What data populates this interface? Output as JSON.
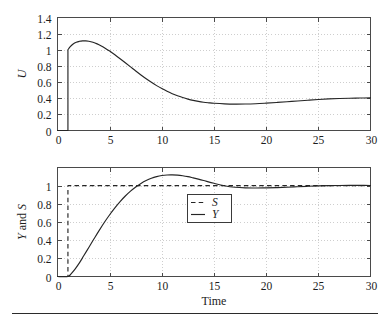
{
  "figure": {
    "background_color": "#ffffff",
    "line_color": "#252525",
    "grid_color": "#b9b9b9",
    "frame_color": "#4a4a4a",
    "bottom_rule": true
  },
  "chart_data": [
    {
      "type": "line",
      "panel": "top",
      "title": "",
      "xlabel": "",
      "ylabel": "U",
      "xlim": [
        0,
        30
      ],
      "ylim": [
        0,
        1.4
      ],
      "grid": true,
      "legend": null,
      "xticks": [
        0,
        5,
        10,
        15,
        20,
        25,
        30
      ],
      "xtick_labels": [
        "0",
        "5",
        "10",
        "15",
        "20",
        "25",
        "30"
      ],
      "yticks": [
        0,
        0.2,
        0.4,
        0.6,
        0.8,
        1,
        1.2,
        1.4
      ],
      "ytick_labels": [
        "0",
        "0.2",
        "0.4",
        "0.6",
        "0.8",
        "1",
        "1.2",
        "1.4"
      ],
      "series": [
        {
          "name": "U",
          "style": "solid",
          "x": [
            0,
            0.5,
            1.0,
            1.0,
            1.2,
            1.5,
            1.8,
            2.1,
            2.4,
            2.7,
            3.0,
            3.4,
            3.8,
            4.2,
            4.6,
            5.0,
            5.5,
            6.0,
            6.5,
            7.0,
            7.5,
            8.0,
            8.5,
            9.0,
            9.5,
            10.0,
            10.5,
            11.0,
            11.5,
            12.0,
            12.5,
            13.0,
            13.5,
            14.0,
            14.5,
            15.0,
            16.0,
            17.0,
            18.0,
            19.0,
            20.0,
            21.0,
            22.0,
            23.0,
            24.0,
            25.0,
            26.0,
            27.0,
            28.0,
            29.0,
            30.0
          ],
          "y": [
            0,
            0,
            0,
            1.0,
            1.035,
            1.072,
            1.094,
            1.105,
            1.11,
            1.11,
            1.106,
            1.093,
            1.073,
            1.047,
            1.017,
            0.984,
            0.938,
            0.889,
            0.839,
            0.788,
            0.737,
            0.688,
            0.641,
            0.597,
            0.556,
            0.519,
            0.486,
            0.456,
            0.43,
            0.408,
            0.389,
            0.373,
            0.36,
            0.35,
            0.343,
            0.337,
            0.33,
            0.327,
            0.328,
            0.332,
            0.339,
            0.347,
            0.356,
            0.366,
            0.375,
            0.384,
            0.391,
            0.396,
            0.4,
            0.402,
            0.404
          ]
        }
      ]
    },
    {
      "type": "line",
      "panel": "bottom",
      "title": "",
      "xlabel": "Time",
      "ylabel": "Y and S",
      "xlim": [
        0,
        30
      ],
      "ylim": [
        0,
        1.2
      ],
      "grid": true,
      "legend_position": "center",
      "xticks": [
        0,
        5,
        10,
        15,
        20,
        25,
        30
      ],
      "xtick_labels": [
        "0",
        "5",
        "10",
        "15",
        "20",
        "25",
        "30"
      ],
      "yticks": [
        0,
        0.2,
        0.4,
        0.6,
        0.8,
        1
      ],
      "ytick_labels": [
        "0",
        "0.2",
        "0.4",
        "0.6",
        "0.8",
        "1"
      ],
      "series": [
        {
          "name": "S",
          "style": "dashed",
          "x": [
            0,
            1.0,
            1.0,
            30
          ],
          "y": [
            0,
            0,
            1.0,
            1.0
          ]
        },
        {
          "name": "Y",
          "style": "solid",
          "x": [
            0,
            1.0,
            1.3,
            1.7,
            2.1,
            2.5,
            3.0,
            3.5,
            4.0,
            4.5,
            5.0,
            5.5,
            6.0,
            6.5,
            7.0,
            7.5,
            8.0,
            8.5,
            9.0,
            9.5,
            10.0,
            10.5,
            11.0,
            11.5,
            12.0,
            12.5,
            13.0,
            13.5,
            14.0,
            15.0,
            16.0,
            17.0,
            18.0,
            19.0,
            20.0,
            21.0,
            22.0,
            23.0,
            24.0,
            25.0,
            26.0,
            27.0,
            28.0,
            29.0,
            30.0
          ],
          "y": [
            0,
            0,
            0.03,
            0.085,
            0.15,
            0.225,
            0.32,
            0.415,
            0.508,
            0.597,
            0.68,
            0.756,
            0.825,
            0.886,
            0.94,
            0.986,
            1.025,
            1.057,
            1.082,
            1.1,
            1.112,
            1.118,
            1.119,
            1.116,
            1.109,
            1.099,
            1.086,
            1.072,
            1.057,
            1.026,
            0.999,
            0.982,
            0.975,
            0.974,
            0.976,
            0.979,
            0.983,
            0.988,
            0.993,
            0.997,
            1.0,
            1.002,
            1.003,
            1.003,
            1.002
          ]
        }
      ]
    }
  ],
  "top_panel": {
    "ylabel": "U",
    "ytick_labels": [
      "0",
      "0.2",
      "0.4",
      "0.6",
      "0.8",
      "1",
      "1.2",
      "1.4"
    ],
    "xtick_labels": [
      "0",
      "5",
      "10",
      "15",
      "20",
      "25",
      "30"
    ]
  },
  "bottom_panel": {
    "ylabel_parts": [
      "Y",
      " and ",
      "S"
    ],
    "xlabel": "Time",
    "ytick_labels": [
      "0",
      "0.2",
      "0.4",
      "0.6",
      "0.8",
      "1"
    ],
    "xtick_labels": [
      "0",
      "5",
      "10",
      "15",
      "20",
      "25",
      "30"
    ],
    "legend": {
      "entries": [
        {
          "label": "S",
          "style": "dashed"
        },
        {
          "label": "Y",
          "style": "solid"
        }
      ]
    }
  }
}
